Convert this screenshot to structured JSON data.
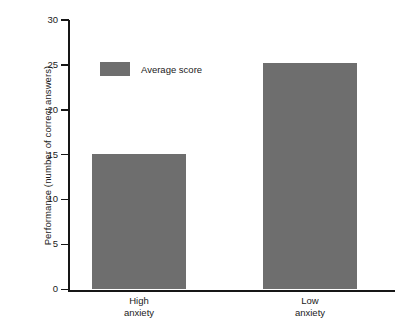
{
  "chart_data": {
    "type": "bar",
    "title": "",
    "subtitle": "",
    "categories": [
      "High anxiety",
      "Low anxiety"
    ],
    "category_lines": [
      [
        "High",
        "anxiety"
      ],
      [
        "Low",
        "anxiety"
      ]
    ],
    "values": [
      15.1,
      25.2
    ],
    "series": [
      {
        "name": "Average score",
        "values": [
          15.1,
          25.2
        ]
      }
    ],
    "xlabel": "",
    "ylabel": "Performance (number of correct answers)",
    "ylim": [
      0,
      30
    ],
    "ytick_values": [
      0,
      5,
      10,
      15,
      20,
      25,
      30
    ],
    "ytick_labels": [
      "0",
      "5",
      "10",
      "15",
      "20",
      "25",
      "30"
    ],
    "grid": false,
    "legend": {
      "position": "upper-left-inside",
      "entries": [
        {
          "label": "Average score",
          "color": "#6e6e6e"
        }
      ]
    },
    "colors": {
      "bar": "#6e6e6e",
      "axis": "#161616",
      "text": "#1a1a1a",
      "background": "#ffffff"
    }
  },
  "axis": {
    "y_title": "Performance (number of correct answers)"
  },
  "legend": {
    "label": "Average score"
  },
  "ticks": {
    "t0": "0",
    "t5": "5",
    "t10": "10",
    "t15": "15",
    "t20": "20",
    "t25": "25",
    "t30": "30"
  },
  "categories": {
    "c0_line1": "High",
    "c0_line2": "anxiety",
    "c1_line1": "Low",
    "c1_line2": "anxiety"
  }
}
